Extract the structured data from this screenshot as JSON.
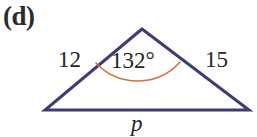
{
  "figure": {
    "part_label": "(d)",
    "type": "geometry-diagram",
    "shape": "triangle",
    "background_color": "#ffffff",
    "stroke_color": "#3d3d73",
    "arc_color": "#d4703c",
    "text_color": "#262626",
    "labels": {
      "left_side": "12",
      "right_side": "15",
      "vertex_angle": "132°",
      "base": "p"
    },
    "geometry": {
      "apex": [
        142,
        29
      ],
      "left_vertex": [
        45,
        110
      ],
      "right_vertex": [
        249,
        110
      ],
      "stroke_width": 3,
      "arc_stroke_width": 1.6
    }
  }
}
